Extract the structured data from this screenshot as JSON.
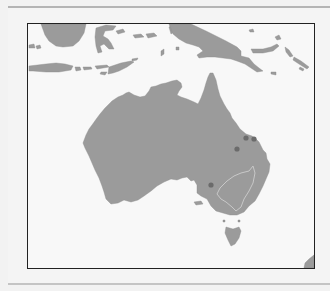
{
  "map": {
    "region": "Australia and surrounding islands",
    "colors": {
      "land": "#9b9b9b",
      "water": "#f8f8f8",
      "frame": "#222222",
      "marker": "#6b6b6b",
      "internal_boundary": "#c8c8c8"
    },
    "features": [
      {
        "name": "Australia"
      },
      {
        "name": "Tasmania"
      },
      {
        "name": "New Guinea"
      },
      {
        "name": "Borneo"
      },
      {
        "name": "Sulawesi"
      },
      {
        "name": "Java"
      },
      {
        "name": "Lesser Sunda Islands"
      },
      {
        "name": "Solomon Islands"
      },
      {
        "name": "New Zealand (partial)"
      }
    ],
    "markers": [
      {
        "label": "marker-1",
        "x": 245,
        "y": 137
      },
      {
        "label": "marker-2",
        "x": 253,
        "y": 138
      },
      {
        "label": "marker-3",
        "x": 236,
        "y": 148
      },
      {
        "label": "marker-4",
        "x": 210,
        "y": 184
      }
    ],
    "internal_boundary": "Murray-Darling basin outline (light line)"
  }
}
